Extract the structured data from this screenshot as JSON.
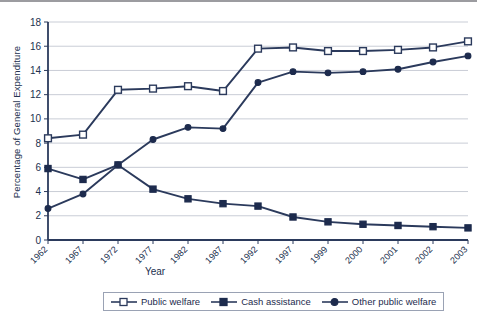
{
  "chart_data": {
    "type": "line",
    "title": "",
    "xlabel": "Year",
    "ylabel": "Percentage of General Expenditure",
    "categories": [
      "1962",
      "1967",
      "1972",
      "1977",
      "1982",
      "1987",
      "1992",
      "1997",
      "1999",
      "2000",
      "2001",
      "2002",
      "2003"
    ],
    "ylim": [
      0,
      18
    ],
    "yticks": [
      0,
      2,
      4,
      6,
      8,
      10,
      12,
      14,
      16,
      18
    ],
    "grid": true,
    "legend_position": "bottom",
    "series": [
      {
        "name": "Public welfare",
        "marker": "open-square",
        "color": "#2b3a5c",
        "values": [
          8.4,
          8.7,
          12.4,
          12.5,
          12.7,
          12.3,
          15.8,
          15.9,
          15.6,
          15.6,
          15.7,
          15.9,
          16.4
        ]
      },
      {
        "name": "Cash assistance",
        "marker": "filled-square",
        "color": "#2b3a5c",
        "values": [
          5.9,
          5.0,
          6.2,
          4.2,
          3.4,
          3.0,
          2.8,
          1.9,
          1.5,
          1.3,
          1.2,
          1.1,
          1.0
        ]
      },
      {
        "name": "Other public welfare",
        "marker": "filled-circle",
        "color": "#2b3a5c",
        "values": [
          2.6,
          3.8,
          6.2,
          8.3,
          9.3,
          9.2,
          13.0,
          13.9,
          13.8,
          13.9,
          14.1,
          14.7,
          15.2
        ]
      }
    ]
  },
  "axis": {
    "y_title": "Percentage of General Expenditure",
    "x_title": "Year"
  },
  "legend": {
    "items": [
      {
        "label": "Public welfare"
      },
      {
        "label": "Cash assistance"
      },
      {
        "label": "Other public welfare"
      }
    ]
  },
  "colors": {
    "line": "#2b3a5c",
    "grid": "#c9cdd6",
    "axis": "#2b3a5c",
    "text": "#22304e"
  }
}
